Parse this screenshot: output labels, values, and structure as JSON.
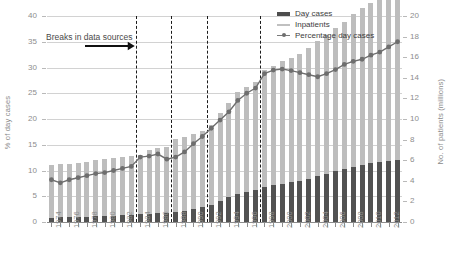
{
  "chart_data": {
    "type": "bar",
    "title": "",
    "subtitle": "",
    "xlabel": "",
    "ylabel": "% of day cases",
    "y2label": "No. of patients (millions)",
    "ylim": [
      0,
      40
    ],
    "y2lim": [
      0,
      20
    ],
    "grid": true,
    "legend_position": "top-right",
    "y_ticks": [
      "0",
      "5",
      "10",
      "15",
      "20",
      "25",
      "30",
      "35",
      "40"
    ],
    "y2_ticks": [
      "0",
      "2",
      "4",
      "6",
      "8",
      "10",
      "12",
      "14",
      "16",
      "18",
      "20"
    ],
    "x": [
      1974,
      1975,
      1976,
      1977,
      1978,
      1979,
      1980,
      1981,
      1982,
      1983,
      1984,
      1985,
      1986,
      1987,
      1988,
      1989,
      1990,
      1991,
      1992,
      1993,
      1994,
      1995,
      1996,
      1997,
      1998,
      1999,
      2000,
      2001,
      2002,
      2003,
      2004,
      2005,
      2006,
      2007,
      2008,
      2009,
      2010,
      2011,
      2012,
      2013
    ],
    "x_tick_labels": [
      "1974",
      "1976",
      "1978",
      "1980",
      "1982",
      "1984",
      "1986",
      "1988",
      "1990",
      "1992",
      "1994",
      "1996",
      "1998",
      "2000",
      "2002",
      "2004",
      "2006",
      "2008",
      "2010",
      "2012"
    ],
    "series": [
      {
        "name": "Day cases",
        "axis": "right",
        "unit": "millions",
        "color": "#525252",
        "values": [
          0.42,
          0.45,
          0.47,
          0.5,
          0.52,
          0.55,
          0.58,
          0.62,
          0.66,
          0.7,
          0.75,
          0.8,
          0.86,
          0.92,
          1.0,
          1.1,
          1.25,
          1.45,
          1.7,
          2.0,
          2.4,
          2.7,
          2.95,
          3.15,
          3.4,
          3.55,
          3.7,
          3.85,
          4.0,
          4.2,
          4.45,
          4.7,
          4.95,
          5.15,
          5.35,
          5.55,
          5.7,
          5.85,
          5.95,
          6.05
        ]
      },
      {
        "name": "Inpatients",
        "axis": "right",
        "unit": "millions",
        "color": "#bdbdbd",
        "values": [
          5.1,
          5.15,
          5.2,
          5.25,
          5.35,
          5.45,
          5.55,
          5.6,
          5.65,
          5.7,
          5.8,
          6.2,
          6.3,
          6.4,
          7.05,
          7.15,
          7.3,
          7.4,
          7.75,
          8.6,
          9.2,
          9.9,
          10.2,
          10.45,
          11.4,
          11.6,
          11.9,
          12.1,
          12.3,
          12.7,
          13.1,
          13.5,
          13.9,
          14.3,
          14.8,
          15.2,
          15.6,
          16.0,
          16.4,
          16.9
        ]
      },
      {
        "name": "Percentage day cases",
        "axis": "left",
        "unit": "%",
        "color": "#6e6e6e",
        "values": [
          8.2,
          7.6,
          8.2,
          8.6,
          9.0,
          9.4,
          9.6,
          10.0,
          10.4,
          10.8,
          12.6,
          12.8,
          13.2,
          12.2,
          12.6,
          13.6,
          15.2,
          16.6,
          18.2,
          19.8,
          21.4,
          23.6,
          25.0,
          26.0,
          28.8,
          29.5,
          29.7,
          29.4,
          29.0,
          28.6,
          28.2,
          28.8,
          29.6,
          30.6,
          31.2,
          31.6,
          32.4,
          33.0,
          34.0,
          35.0
        ]
      }
    ],
    "annotation": {
      "text": "Breaks in data sources",
      "icon": "right-arrow-icon"
    },
    "break_years": [
      1983.5,
      1987.5,
      1991.5,
      1997.5
    ]
  }
}
